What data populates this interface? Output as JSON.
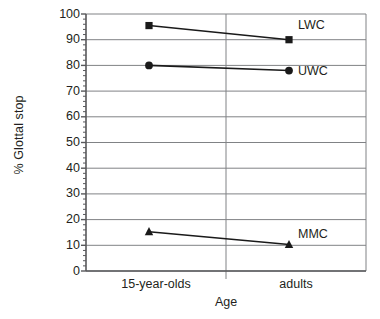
{
  "chart_data": {
    "type": "line",
    "title": "",
    "xlabel": "Age",
    "ylabel": "% Glottal stop",
    "categories": [
      "15-year-olds",
      "adults"
    ],
    "ylim": [
      0,
      100
    ],
    "ytick_step": 10,
    "yticks": [
      0,
      10,
      20,
      30,
      40,
      50,
      60,
      70,
      80,
      90,
      100
    ],
    "ytick_labels": [
      "0",
      "10",
      "20",
      "30",
      "40",
      "50",
      "60",
      "70",
      "80",
      "90",
      "100"
    ],
    "grid": "horizontal",
    "legend_position": "inline-right",
    "series": [
      {
        "name": "LWC",
        "marker": "square",
        "color": "#1a1a1a",
        "values": [
          95.5,
          90.0
        ]
      },
      {
        "name": "UWC",
        "marker": "circle",
        "color": "#1a1a1a",
        "values": [
          80.0,
          78.0
        ]
      },
      {
        "name": "MMC",
        "marker": "triangle",
        "color": "#1a1a1a",
        "values": [
          15.3,
          10.3
        ]
      }
    ],
    "colors": {
      "axis": "#58585b",
      "grid": "#808285",
      "series": "#1a1a1a",
      "background": "#ffffff",
      "text": "#231f20"
    }
  }
}
